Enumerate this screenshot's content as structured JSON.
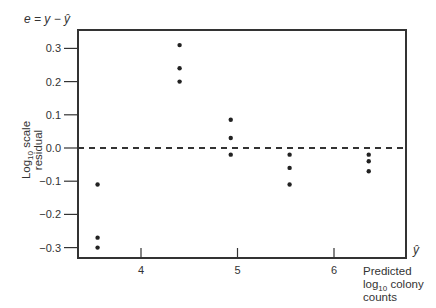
{
  "chart_data": {
    "type": "scatter",
    "title": "",
    "ylabel_top": "e = y − ŷ",
    "ylabel": "Log10 scale residual",
    "ylabel_lines": [
      "Log",
      "10",
      " scale",
      "residual"
    ],
    "xlabel_symbol": "ŷ",
    "xlabel_lines": [
      "Predicted",
      "log",
      "10",
      " colony",
      "counts"
    ],
    "xlabel": "Predicted log10 colony counts",
    "x_ticks": [
      4,
      5,
      6
    ],
    "x_tick_labels": [
      "4",
      "5",
      "6"
    ],
    "y_ticks": [
      0.3,
      0.2,
      0.1,
      0.0,
      -0.1,
      -0.2,
      -0.3
    ],
    "y_tick_labels": [
      "0.3",
      "0.2",
      "0.1",
      "0.0",
      "−0.1",
      "−0.2",
      "−0.3"
    ],
    "xlim": [
      3.4,
      7.1
    ],
    "ylim": [
      -0.33,
      0.36
    ],
    "grid": false,
    "reference_line": {
      "y": 0.0,
      "style": "dashed"
    },
    "points": [
      {
        "x": 3.55,
        "y": -0.11
      },
      {
        "x": 3.55,
        "y": -0.27
      },
      {
        "x": 3.55,
        "y": -0.3
      },
      {
        "x": 4.4,
        "y": 0.31
      },
      {
        "x": 4.4,
        "y": 0.24
      },
      {
        "x": 4.4,
        "y": 0.2
      },
      {
        "x": 4.93,
        "y": 0.085
      },
      {
        "x": 4.93,
        "y": 0.03
      },
      {
        "x": 4.93,
        "y": -0.02
      },
      {
        "x": 5.54,
        "y": -0.02
      },
      {
        "x": 5.54,
        "y": -0.06
      },
      {
        "x": 5.54,
        "y": -0.11
      },
      {
        "x": 6.36,
        "y": -0.02
      },
      {
        "x": 6.36,
        "y": -0.04
      },
      {
        "x": 6.36,
        "y": -0.07
      }
    ]
  },
  "colors": {
    "axis": "#333333",
    "point": "#222222",
    "text": "#333333"
  }
}
